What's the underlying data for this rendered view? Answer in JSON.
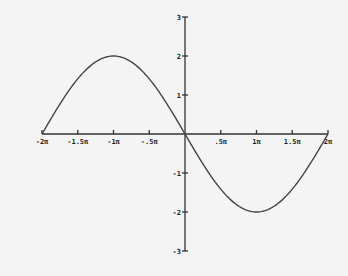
{
  "chart_data": {
    "type": "line",
    "title": "",
    "xlabel": "",
    "ylabel": "",
    "function": "y = -2 sin(x)",
    "xlim": [
      -6.2832,
      6.2832
    ],
    "ylim": [
      -3,
      3
    ],
    "grid": false,
    "legend": null,
    "x_ticks": [
      {
        "value": -6.2832,
        "label": "-2π"
      },
      {
        "value": -4.7124,
        "label": "-1.5π"
      },
      {
        "value": -3.1416,
        "label": "-1π"
      },
      {
        "value": -1.5708,
        "label": "-.5π"
      },
      {
        "value": 1.5708,
        "label": ".5π"
      },
      {
        "value": 3.1416,
        "label": "1π"
      },
      {
        "value": 4.7124,
        "label": "1.5π"
      },
      {
        "value": 6.2832,
        "label": "2π"
      }
    ],
    "y_ticks": [
      {
        "value": 3,
        "label": "3"
      },
      {
        "value": 2,
        "label": "2"
      },
      {
        "value": 1,
        "label": "1"
      },
      {
        "value": -1,
        "label": "-1"
      },
      {
        "value": -2,
        "label": "-2"
      },
      {
        "value": -3,
        "label": "-3"
      }
    ],
    "series": [
      {
        "name": "curve",
        "x": [
          -6.2832,
          -4.7124,
          -3.1416,
          -1.5708,
          0,
          1.5708,
          3.1416,
          4.7124,
          6.2832
        ],
        "y": [
          0,
          -1.414,
          0,
          1.414,
          0,
          -1.414,
          0,
          1.414,
          0
        ],
        "note": "Half-period sine: rises from 0 at -2π to max 2 at -π, back to 0 at 0, min -2 at π, 0 at 2π; y = 2 sin(x/2) reflected: y = -2 sin(x/2)"
      }
    ],
    "extrema": [
      {
        "x": -3.1416,
        "y": 2,
        "type": "max"
      },
      {
        "x": 3.1416,
        "y": -2,
        "type": "min"
      }
    ]
  }
}
